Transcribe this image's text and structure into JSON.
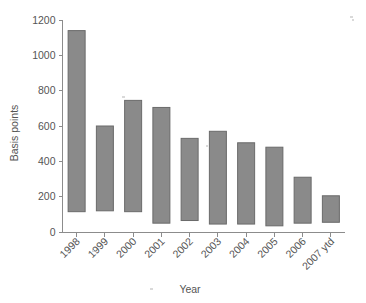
{
  "chart_data": {
    "type": "bar",
    "subtype": "floating-range-bar",
    "title": "",
    "xlabel": "Year",
    "ylabel": "Basis points",
    "categories": [
      "1998",
      "1999",
      "2000",
      "2001",
      "2002",
      "2003",
      "2004",
      "2005",
      "2006",
      "2007 ytd"
    ],
    "series": [
      {
        "name": "Range high",
        "values": [
          1140,
          600,
          745,
          705,
          530,
          570,
          505,
          480,
          310,
          205
        ]
      },
      {
        "name": "Range low",
        "values": [
          115,
          120,
          115,
          50,
          65,
          45,
          45,
          35,
          50,
          55
        ]
      }
    ],
    "values": [
      1140,
      600,
      745,
      705,
      530,
      570,
      505,
      480,
      310,
      205
    ],
    "bar_bottoms": [
      115,
      120,
      115,
      50,
      65,
      45,
      45,
      35,
      50,
      55
    ],
    "ylim": [
      0,
      1200
    ],
    "yticks": [
      0,
      200,
      400,
      600,
      800,
      1000,
      1200
    ],
    "ytick_labels": [
      "0",
      "200",
      "400",
      "600",
      "800",
      "1000",
      "1200"
    ],
    "grid": false,
    "legend": "none",
    "bar_color": "#8a8a8a",
    "bar_edge_color": "#6a6a6a",
    "axis_color": "#8c8c8c",
    "text_color": "#555555",
    "xtick_rotation": -45
  }
}
